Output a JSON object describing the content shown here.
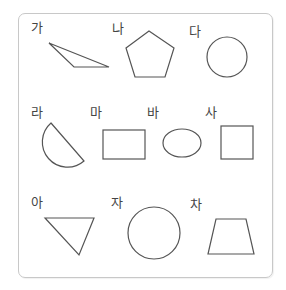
{
  "labels": [
    {
      "text": "가",
      "x": 31,
      "y": 21
    },
    {
      "text": "나",
      "x": 112,
      "y": 22
    },
    {
      "text": "다",
      "x": 189,
      "y": 25
    },
    {
      "text": "라",
      "x": 31,
      "y": 106
    },
    {
      "text": "마",
      "x": 90,
      "y": 106
    },
    {
      "text": "바",
      "x": 147,
      "y": 106
    },
    {
      "text": "사",
      "x": 205,
      "y": 106
    },
    {
      "text": "아",
      "x": 31,
      "y": 196
    },
    {
      "text": "자",
      "x": 111,
      "y": 196
    },
    {
      "text": "차",
      "x": 190,
      "y": 198
    }
  ],
  "shapes": {
    "ga": {
      "type": "obtuse-triangle",
      "points": "49,43 74,67 109,67"
    },
    "na": {
      "type": "pentagon",
      "points": "149,31 174,48 165,77 135,77 126,48"
    },
    "da": {
      "type": "circle",
      "cx": 227,
      "cy": 57,
      "r": 20
    },
    "ra": {
      "type": "semicircle",
      "d": "M51,123 L84,161 A25,25 0 0 1 51,123 Z"
    },
    "ma": {
      "type": "rectangle",
      "x": 103,
      "y": 130,
      "w": 42,
      "h": 29
    },
    "ba": {
      "type": "ellipse",
      "cx": 182,
      "cy": 143,
      "rx": 19,
      "ry": 14
    },
    "sa": {
      "type": "square",
      "x": 221,
      "y": 126,
      "w": 32,
      "h": 33
    },
    "a": {
      "type": "triangle",
      "points": "45,218 94,218 79,255"
    },
    "ja": {
      "type": "circle",
      "cx": 154,
      "cy": 233,
      "r": 26
    },
    "cha": {
      "type": "trapezoid",
      "points": "216,219 246,219 254,254 208,254"
    }
  }
}
